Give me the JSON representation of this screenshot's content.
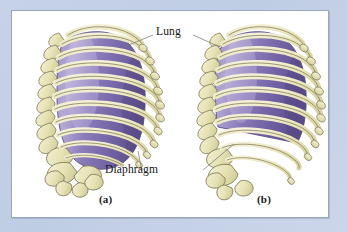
{
  "figure": {
    "panel_background": "#ffffff",
    "page_background": "#c3d0e6",
    "border_color": "#9aa6bb"
  },
  "callouts": [
    {
      "id": "lung",
      "label": "Lung",
      "x": 160,
      "y": 32
    },
    {
      "id": "diaphragm",
      "label": "Diaphragm",
      "x": 141,
      "y": 166
    }
  ],
  "sublabels": [
    {
      "id": "panel-a",
      "label": "(a)",
      "x": 101,
      "y": 196
    },
    {
      "id": "panel-b",
      "label": "(b)",
      "x": 258,
      "y": 196
    }
  ],
  "anatomy": {
    "lung_name": "Lung",
    "diaphragm_name": "Diaphragm",
    "rib_count_per_figure": 11,
    "figures": [
      {
        "id": "a",
        "caption": "(a)",
        "lung_base_shape": "rounded",
        "description": "Rib cage with lung filling the thoracic cavity to a rounded inferior border"
      },
      {
        "id": "b",
        "caption": "(b)",
        "lung_base_shape": "diagonal",
        "description": "Rib cage with lung inferior border raised along a diagonal, lower ribs empty"
      }
    ]
  },
  "colors": {
    "bone_fill": "#e9e5bb",
    "bone_fill_light": "#f2efd2",
    "bone_fill_shade": "#d8d3a0",
    "bone_outline": "#7d7752",
    "lung_mid": "#8a7ab8",
    "lung_light": "#b3a8d4",
    "lung_dark": "#6a5a9a",
    "lung_outline": "#5c4f88",
    "leader_line": "#7a7a7a",
    "text": "#141414"
  }
}
